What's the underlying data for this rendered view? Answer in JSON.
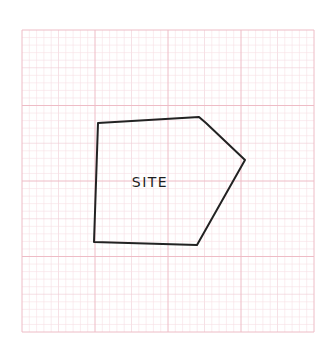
{
  "diagram": {
    "type": "site-plan-sketch",
    "label": "SITE",
    "colors": {
      "background": "#ffffff",
      "grid_minor": "#f6dfe4",
      "grid_major": "#eebcc6",
      "outline": "#222222"
    },
    "grid": {
      "left": 22,
      "top": 30,
      "right": 314,
      "bottom": 332,
      "major_divisions_x": 4,
      "major_divisions_y": 4,
      "minor_per_major": 10
    },
    "site_polygon": {
      "points": [
        [
          98,
          123
        ],
        [
          199,
          117
        ],
        [
          206,
          123
        ],
        [
          245,
          160
        ],
        [
          197,
          245
        ],
        [
          94,
          242
        ]
      ]
    }
  }
}
